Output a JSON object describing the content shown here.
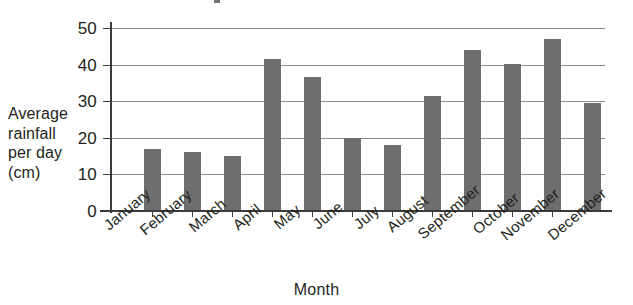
{
  "chart_data": {
    "type": "bar",
    "title": "",
    "xlabel": "Month",
    "ylabel": "Average rainfall per day (cm)",
    "ylabel_lines": [
      "Average",
      "rainfall",
      "per day",
      "(cm)"
    ],
    "categories": [
      "January",
      "February",
      "March",
      "April",
      "May",
      "June",
      "July",
      "August",
      "September",
      "October",
      "November",
      "December"
    ],
    "values": [
      17,
      16,
      15,
      41.5,
      36.5,
      20,
      18,
      31.5,
      44,
      40.3,
      47,
      29.5
    ],
    "ylim": [
      0,
      50
    ],
    "yticks": [
      0,
      10,
      20,
      30,
      40,
      50
    ],
    "ytick_labels": [
      "0",
      "10",
      "20",
      "30",
      "40",
      "50"
    ],
    "grid": "horizontal",
    "legend": "none",
    "bar_color": "#6e6e6e",
    "axis_color": "#3b3b3b",
    "gridline_color": "#8a8a8a",
    "xtick_label_rotation_degrees": -40
  },
  "axes": {
    "y_title_line_1": "Average",
    "y_title_line_2": "rainfall",
    "y_title_line_3": "per day",
    "y_title_line_4": "(cm)",
    "x_title": "Month"
  },
  "ytick": {
    "t0": "0",
    "t10": "10",
    "t20": "20",
    "t30": "30",
    "t40": "40",
    "t50": "50"
  },
  "xtick": {
    "m1": "January",
    "m2": "February",
    "m3": "March",
    "m4": "April",
    "m5": "May",
    "m6": "June",
    "m7": "July",
    "m8": "August",
    "m9": "September",
    "m10": "October",
    "m11": "November",
    "m12": "December"
  }
}
